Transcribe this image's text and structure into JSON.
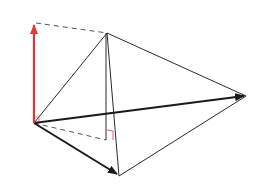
{
  "diagram": {
    "colors": {
      "background": "#ffffff",
      "edge": "#2a2a2a",
      "vector": "#1a1a1a",
      "red_vector": "#e0383a",
      "dashed": "#555555",
      "right_angle": "#e0607a"
    },
    "points": {
      "origin": [
        34,
        123
      ],
      "red_tip": [
        34,
        23
      ],
      "apex": [
        107,
        33
      ],
      "right_vertex": [
        246,
        96
      ],
      "bottom_vertex": [
        119,
        176
      ],
      "foot": [
        107,
        140
      ]
    }
  }
}
